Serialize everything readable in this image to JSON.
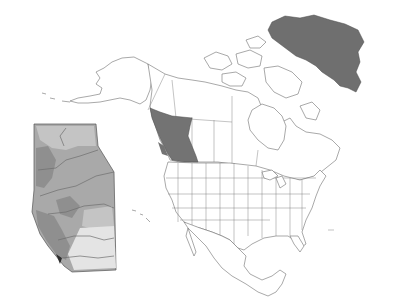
{
  "map": {
    "subject": "North America",
    "highlighted_regions": [
      {
        "name": "British Columbia",
        "color": "#737373"
      },
      {
        "name": "Greenland",
        "color": "#6f6f6f"
      }
    ],
    "base_fill": "#ffffff",
    "border_color": "#6e6e6e"
  },
  "inset": {
    "subject": "Alberta",
    "shade_colors": {
      "dark": "#8f8f8f",
      "mid": "#a9a9a9",
      "light": "#c4c4c4",
      "lightest": "#e4e4e4",
      "edge_dark": "#2e2e2e"
    }
  }
}
